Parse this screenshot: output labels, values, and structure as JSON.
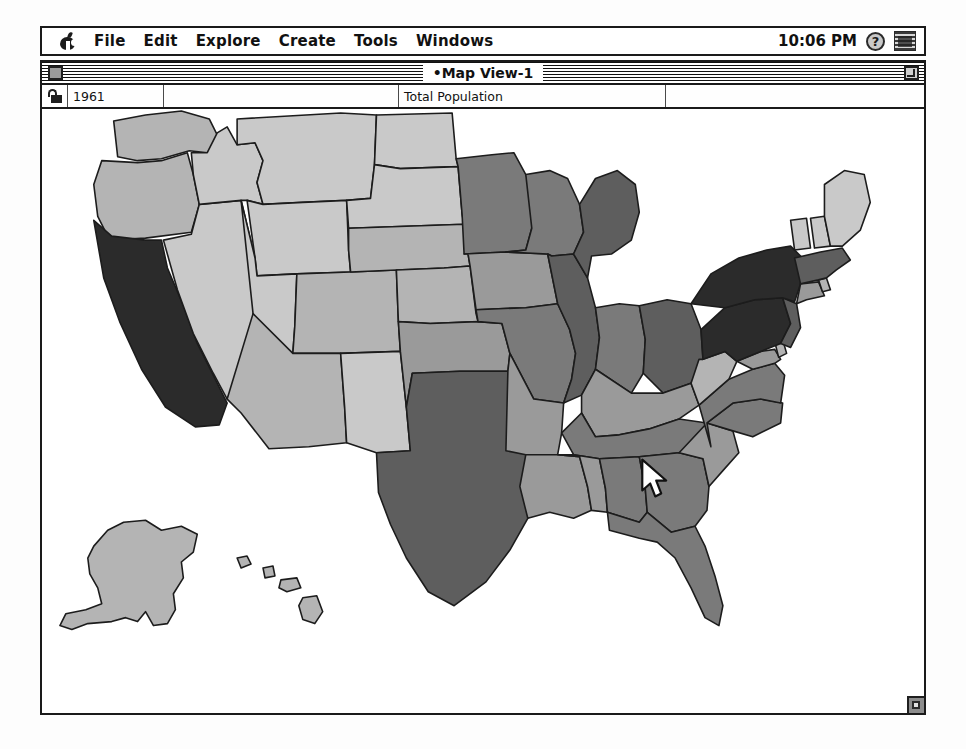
{
  "menubar": {
    "apple_icon": "apple-logo-icon",
    "items": [
      {
        "label": "File"
      },
      {
        "label": "Edit"
      },
      {
        "label": "Explore"
      },
      {
        "label": "Create"
      },
      {
        "label": "Tools"
      },
      {
        "label": "Windows"
      }
    ],
    "clock": "10:06 PM",
    "help_icon_label": "?",
    "help_icon": "help-question-icon",
    "app_menu_icon": "application-switcher-icon"
  },
  "window": {
    "title": "•Map View-1",
    "close_box": "close-box-icon",
    "zoom_box": "zoom-box-icon",
    "grow_box": "resize-grip-icon"
  },
  "toolbar": {
    "lock_icon": "padlock-icon",
    "year_value": "1961",
    "year_placeholder": "",
    "empty_value": "",
    "layer_value": "Total Population",
    "tail_value": ""
  },
  "map": {
    "title": "United States choropleth map",
    "shade_legend": [
      {
        "name": "lightest",
        "color": "#c9c9c9"
      },
      {
        "name": "light",
        "color": "#b4b4b4"
      },
      {
        "name": "medium",
        "color": "#9a9a9a"
      },
      {
        "name": "dark",
        "color": "#7a7a7a"
      },
      {
        "name": "darker",
        "color": "#5e5e5e"
      },
      {
        "name": "darkest",
        "color": "#2b2b2b"
      }
    ],
    "cursor": {
      "x": 645,
      "y": 462,
      "icon": "arrow-pointer-icon"
    }
  },
  "chart_data": {
    "type": "map",
    "title": "Total Population",
    "year": "1961",
    "variable": "Total Population",
    "projection": "Albers USA with Alaska and Hawaii insets",
    "color_scale": "6-step grayscale, light = low population, dark = high population",
    "regions": [
      {
        "code": "CA",
        "name": "California",
        "shade": "darkest"
      },
      {
        "code": "NY",
        "name": "New York",
        "shade": "darkest"
      },
      {
        "code": "PA",
        "name": "Pennsylvania",
        "shade": "darkest"
      },
      {
        "code": "IL",
        "name": "Illinois",
        "shade": "darker"
      },
      {
        "code": "OH",
        "name": "Ohio",
        "shade": "darker"
      },
      {
        "code": "TX",
        "name": "Texas",
        "shade": "darker"
      },
      {
        "code": "MI",
        "name": "Michigan",
        "shade": "darker"
      },
      {
        "code": "NJ",
        "name": "New Jersey",
        "shade": "darker"
      },
      {
        "code": "MA",
        "name": "Massachusetts",
        "shade": "darker"
      },
      {
        "code": "FL",
        "name": "Florida",
        "shade": "dark"
      },
      {
        "code": "GA",
        "name": "Georgia",
        "shade": "dark"
      },
      {
        "code": "NC",
        "name": "North Carolina",
        "shade": "dark"
      },
      {
        "code": "IN",
        "name": "Indiana",
        "shade": "dark"
      },
      {
        "code": "MO",
        "name": "Missouri",
        "shade": "dark"
      },
      {
        "code": "WI",
        "name": "Wisconsin",
        "shade": "dark"
      },
      {
        "code": "MN",
        "name": "Minnesota",
        "shade": "dark"
      },
      {
        "code": "TN",
        "name": "Tennessee",
        "shade": "dark"
      },
      {
        "code": "AL",
        "name": "Alabama",
        "shade": "dark"
      },
      {
        "code": "VA",
        "name": "Virginia",
        "shade": "dark"
      },
      {
        "code": "LA",
        "name": "Louisiana",
        "shade": "medium"
      },
      {
        "code": "KY",
        "name": "Kentucky",
        "shade": "medium"
      },
      {
        "code": "SC",
        "name": "South Carolina",
        "shade": "medium"
      },
      {
        "code": "IA",
        "name": "Iowa",
        "shade": "medium"
      },
      {
        "code": "OK",
        "name": "Oklahoma",
        "shade": "medium"
      },
      {
        "code": "MS",
        "name": "Mississippi",
        "shade": "medium"
      },
      {
        "code": "AR",
        "name": "Arkansas",
        "shade": "medium"
      },
      {
        "code": "KS",
        "name": "Kansas",
        "shade": "light"
      },
      {
        "code": "WA",
        "name": "Washington",
        "shade": "light"
      },
      {
        "code": "MD",
        "name": "Maryland",
        "shade": "medium"
      },
      {
        "code": "CT",
        "name": "Connecticut",
        "shade": "medium"
      },
      {
        "code": "WV",
        "name": "West Virginia",
        "shade": "light"
      },
      {
        "code": "OR",
        "name": "Oregon",
        "shade": "light"
      },
      {
        "code": "CO",
        "name": "Colorado",
        "shade": "light"
      },
      {
        "code": "AZ",
        "name": "Arizona",
        "shade": "light"
      },
      {
        "code": "NE",
        "name": "Nebraska",
        "shade": "light"
      },
      {
        "code": "NM",
        "name": "New Mexico",
        "shade": "lightest"
      },
      {
        "code": "UT",
        "name": "Utah",
        "shade": "lightest"
      },
      {
        "code": "ID",
        "name": "Idaho",
        "shade": "lightest"
      },
      {
        "code": "MT",
        "name": "Montana",
        "shade": "lightest"
      },
      {
        "code": "WY",
        "name": "Wyoming",
        "shade": "lightest"
      },
      {
        "code": "ND",
        "name": "North Dakota",
        "shade": "lightest"
      },
      {
        "code": "SD",
        "name": "South Dakota",
        "shade": "lightest"
      },
      {
        "code": "NV",
        "name": "Nevada",
        "shade": "lightest"
      },
      {
        "code": "ME",
        "name": "Maine",
        "shade": "lightest"
      },
      {
        "code": "NH",
        "name": "New Hampshire",
        "shade": "lightest"
      },
      {
        "code": "VT",
        "name": "Vermont",
        "shade": "lightest"
      },
      {
        "code": "RI",
        "name": "Rhode Island",
        "shade": "light"
      },
      {
        "code": "DE",
        "name": "Delaware",
        "shade": "light"
      },
      {
        "code": "AK",
        "name": "Alaska",
        "shade": "light"
      },
      {
        "code": "HI",
        "name": "Hawaii",
        "shade": "light"
      }
    ]
  }
}
